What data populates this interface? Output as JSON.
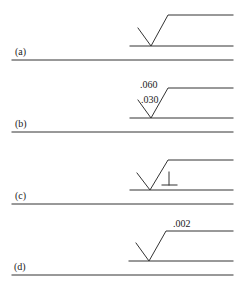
{
  "figure": {
    "stroke_color": "#333333",
    "panels": [
      {
        "id": "a",
        "label": "(a)",
        "symbol": "basic surface texture symbol",
        "annotations": []
      },
      {
        "id": "b",
        "label": "(b)",
        "symbol": "surface texture symbol with roughness values",
        "annotations": [
          ".060",
          ".030"
        ]
      },
      {
        "id": "c",
        "label": "(c)",
        "symbol": "surface texture symbol with lay direction",
        "annotations": [
          "perpendicular-lay-symbol"
        ]
      },
      {
        "id": "d",
        "label": "(d)",
        "symbol": "surface texture symbol with waviness height",
        "annotations": [
          ".002"
        ]
      }
    ]
  }
}
